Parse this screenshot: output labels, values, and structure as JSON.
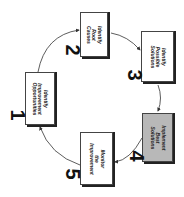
{
  "diagram": {
    "steps": [
      {
        "number": "1",
        "lines": [
          "Identify",
          "Improvement",
          "Opportunities"
        ],
        "highlighted": false
      },
      {
        "number": "2",
        "lines": [
          "Identify",
          "Root",
          "Causes"
        ],
        "highlighted": false
      },
      {
        "number": "3",
        "lines": [
          "Identify",
          "Possible",
          "Solutions"
        ],
        "highlighted": false
      },
      {
        "number": "4",
        "lines": [
          "Implement",
          "Best",
          "Solutions"
        ],
        "highlighted": true
      },
      {
        "number": "5",
        "lines": [
          "Monitor",
          "the",
          "Improvement"
        ],
        "highlighted": false
      }
    ],
    "flow": [
      "1->2",
      "2->3",
      "3->4",
      "4->5",
      "5->1"
    ],
    "colors": {
      "box_fill": "#ffffff",
      "highlight_fill": "#b8b8b8",
      "stroke": "#333333"
    }
  }
}
